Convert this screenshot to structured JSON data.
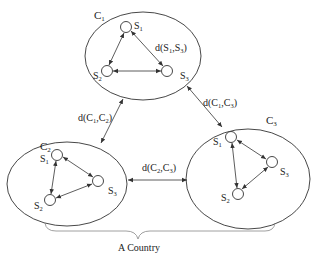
{
  "diagram": {
    "caption": "A Country",
    "stroke_color": "#333333",
    "clusters": [
      {
        "id": "C1",
        "label": "C",
        "sub": "1",
        "cx": 143,
        "cy": 56,
        "rx": 58,
        "ry": 44,
        "label_x": 94,
        "label_y": 19,
        "nodes": [
          {
            "label": "S",
            "sub": "1",
            "x": 126,
            "y": 27,
            "lx": 134,
            "ly": 29
          },
          {
            "label": "S",
            "sub": "2",
            "x": 107,
            "y": 71,
            "lx": 93,
            "ly": 79
          },
          {
            "label": "S",
            "sub": "3",
            "x": 167,
            "y": 71,
            "lx": 180,
            "ly": 79
          }
        ],
        "edge_label": {
          "text": "d(S",
          "s1": "1",
          "mid": ",S",
          "s2": "3",
          "end": ")",
          "x": 155,
          "y": 51
        }
      },
      {
        "id": "C2",
        "label": "C",
        "sub": "2",
        "cx": 67,
        "cy": 184,
        "rx": 60,
        "ry": 42,
        "label_x": 40,
        "label_y": 150,
        "nodes": [
          {
            "label": "S",
            "sub": "1",
            "x": 57,
            "y": 155,
            "lx": 40,
            "ly": 162
          },
          {
            "label": "S",
            "sub": "2",
            "x": 50,
            "y": 200,
            "lx": 34,
            "ly": 209
          },
          {
            "label": "S",
            "sub": "3",
            "x": 98,
            "y": 181,
            "lx": 108,
            "ly": 194
          }
        ]
      },
      {
        "id": "C3",
        "label": "C",
        "sub": "3",
        "cx": 248,
        "cy": 179,
        "rx": 62,
        "ry": 50,
        "label_x": 266,
        "label_y": 124,
        "nodes": [
          {
            "label": "S",
            "sub": "1",
            "x": 231,
            "y": 137,
            "lx": 213,
            "ly": 145
          },
          {
            "label": "S",
            "sub": "2",
            "x": 238,
            "y": 194,
            "lx": 221,
            "ly": 201
          },
          {
            "label": "S",
            "sub": "3",
            "x": 272,
            "y": 162,
            "lx": 280,
            "ly": 175
          }
        ]
      }
    ],
    "inter_edges": [
      {
        "label": "d(C",
        "s1": "1",
        "mid": ",C",
        "s2": "2",
        "end": ")",
        "lx": 78,
        "ly": 121
      },
      {
        "label": "d(C",
        "s1": "1",
        "mid": ",C",
        "s2": "3",
        "end": ")",
        "lx": 203,
        "ly": 106
      },
      {
        "label": "d(C",
        "s1": "2",
        "mid": ",C",
        "s2": "3",
        "end": ")",
        "lx": 142,
        "ly": 171
      }
    ]
  }
}
